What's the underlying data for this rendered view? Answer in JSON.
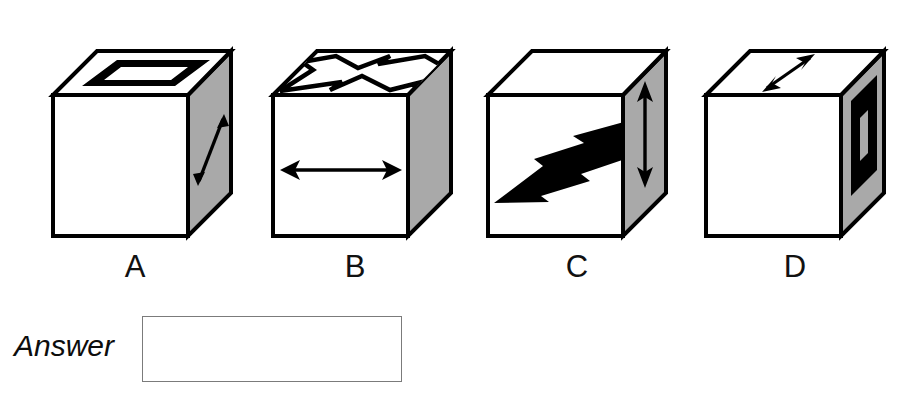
{
  "page": {
    "kind": "multiple-choice-figure-question",
    "background_color": "#ffffff",
    "ink_color": "#000000",
    "shaded_face_color": "#a9a9a9"
  },
  "options": [
    {
      "id": "A",
      "label": "A",
      "left": 20,
      "faces": {
        "front": {
          "symbol": "sun",
          "symbol_name": "sun-icon",
          "fill": "#ffffff"
        },
        "top": {
          "symbol": "rectangle-ring",
          "symbol_name": "rectangle-outline-icon",
          "fill": "#ffffff"
        },
        "right": {
          "symbol": "double-headed-arrow-diagonal",
          "symbol_name": "diagonal-double-arrow-icon",
          "fill": "#a9a9a9"
        }
      }
    },
    {
      "id": "B",
      "label": "B",
      "left": 250,
      "faces": {
        "front": {
          "symbol": "double-headed-arrow-horizontal",
          "symbol_name": "horizontal-double-arrow-icon",
          "fill": "#ffffff"
        },
        "top": {
          "symbol": "lightning-bolt-outline",
          "symbol_name": "lightning-bolt-outline-icon",
          "fill": "#ffffff"
        },
        "right": {
          "symbol": "sun-narrow",
          "symbol_name": "sun-icon",
          "fill": "#a9a9a9"
        }
      }
    },
    {
      "id": "C",
      "label": "C",
      "left": 470,
      "faces": {
        "front": {
          "symbol": "lightning-bolt-solid",
          "symbol_name": "lightning-bolt-solid-icon",
          "fill": "#ffffff"
        },
        "top": {
          "symbol": "sun-flat",
          "symbol_name": "sun-icon",
          "fill": "#ffffff"
        },
        "right": {
          "symbol": "double-headed-arrow-vertical",
          "symbol_name": "vertical-double-arrow-icon",
          "fill": "#a9a9a9"
        }
      }
    },
    {
      "id": "D",
      "label": "D",
      "left": 690,
      "faces": {
        "front": {
          "symbol": "sun",
          "symbol_name": "sun-icon",
          "fill": "#ffffff"
        },
        "top": {
          "symbol": "double-headed-arrow-diagonal-depth",
          "symbol_name": "diagonal-double-arrow-icon",
          "fill": "#ffffff"
        },
        "right": {
          "symbol": "rectangle-ring-vertical",
          "symbol_name": "rectangle-outline-icon",
          "fill": "#a9a9a9"
        }
      }
    }
  ],
  "answer": {
    "label": "Answer",
    "value": "",
    "placeholder": ""
  }
}
